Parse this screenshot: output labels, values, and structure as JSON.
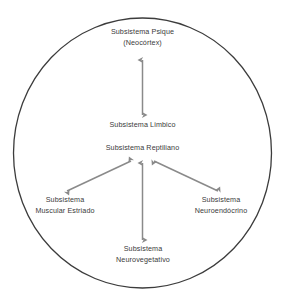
{
  "diagram": {
    "type": "concept-diagram",
    "shape": "circle",
    "colors": {
      "circle_stroke": "#3c3c3c",
      "arrow": "#8a8a8a",
      "text": "#3a3a3a",
      "background": "#ffffff"
    },
    "nodes": [
      {
        "id": "psique",
        "lines": [
          "Subsistema Psique",
          "(Neocórtex)"
        ],
        "position": "top"
      },
      {
        "id": "limbico",
        "lines": [
          "Subsistema Limbico"
        ],
        "position": "upper-center"
      },
      {
        "id": "reptiliano",
        "lines": [
          "Subsistema Reptiliano"
        ],
        "position": "center"
      },
      {
        "id": "muscular_estriado",
        "lines": [
          "Subsistema",
          "Muscular Estriado"
        ],
        "position": "lower-left"
      },
      {
        "id": "neuroendocrino",
        "lines": [
          "Subsistema",
          "Neuroendócrino"
        ],
        "position": "lower-right"
      },
      {
        "id": "neurovegetativo",
        "lines": [
          "Subsistema",
          "Neurovegetativo"
        ],
        "position": "bottom"
      }
    ],
    "connections": [
      {
        "id": "psique-limbico",
        "from": "psique",
        "to": "limbico",
        "style": "double-arrow",
        "orientation": "vertical"
      },
      {
        "id": "reptiliano-muscular",
        "from": "reptiliano",
        "to": "muscular_estriado",
        "style": "double-arrow",
        "orientation": "diagonal-left"
      },
      {
        "id": "reptiliano-neuroendocrino",
        "from": "reptiliano",
        "to": "neuroendocrino",
        "style": "double-arrow",
        "orientation": "diagonal-right"
      },
      {
        "id": "reptiliano-neurovegetativo",
        "from": "reptiliano",
        "to": "neurovegetativo",
        "style": "double-arrow",
        "orientation": "vertical"
      }
    ]
  }
}
